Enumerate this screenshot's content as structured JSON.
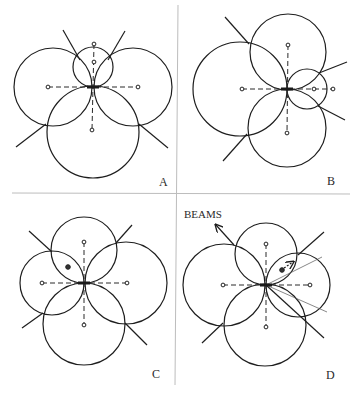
{
  "figure": {
    "dividers": {
      "vertical": {
        "x1": 178,
        "y1": 5,
        "x2": 175,
        "y2": 385
      },
      "horizontal": {
        "x1": 12,
        "y1": 193,
        "x2": 350,
        "y2": 194
      }
    },
    "panels": [
      {
        "label": "A",
        "label_pos": [
          159,
          186
        ],
        "center": [
          93,
          87
        ],
        "circles": [
          {
            "cx": 93,
            "cy": 67,
            "r": 20
          },
          {
            "cx": 53,
            "cy": 87,
            "r": 39
          },
          {
            "cx": 133,
            "cy": 87,
            "r": 39
          },
          {
            "cx": 93,
            "cy": 132,
            "r": 46
          }
        ],
        "dots": [
          [
            94,
            44
          ],
          [
            94,
            62
          ],
          [
            48,
            87
          ],
          [
            138,
            87
          ],
          [
            92,
            130
          ]
        ],
        "dashed": [
          [
            [
              94,
              44
            ],
            [
              92,
              130
            ]
          ],
          [
            [
              48,
              87
            ],
            [
              138,
              87
            ]
          ]
        ],
        "beams": [
          [
            [
              63,
              30
            ],
            [
              80,
              60
            ]
          ],
          [
            [
              125,
              31
            ],
            [
              108,
              60
            ]
          ],
          [
            [
              16,
              147
            ],
            [
              46,
              124
            ]
          ],
          [
            [
              139,
              124
            ],
            [
              168,
              148
            ]
          ]
        ]
      },
      {
        "label": "B",
        "label_pos": [
          327,
          185
        ],
        "center": [
          287,
          89
        ],
        "circles": [
          {
            "cx": 288,
            "cy": 52,
            "r": 38
          },
          {
            "cx": 240,
            "cy": 89,
            "r": 47
          },
          {
            "cx": 307,
            "cy": 89,
            "r": 20
          },
          {
            "cx": 287,
            "cy": 128,
            "r": 39
          }
        ],
        "dots": [
          [
            288,
            45
          ],
          [
            242,
            89
          ],
          [
            314,
            89
          ],
          [
            333,
            89
          ],
          [
            287,
            133
          ]
        ],
        "dashed": [
          [
            [
              288,
              45
            ],
            [
              287,
              133
            ]
          ],
          [
            [
              242,
              89
            ],
            [
              333,
              89
            ]
          ]
        ],
        "beams": [
          [
            [
              225,
              17
            ],
            [
              249,
              44
            ]
          ],
          [
            [
              223,
              161
            ],
            [
              247,
              134
            ]
          ],
          [
            [
              319,
              73
            ],
            [
              347,
              62
            ]
          ],
          [
            [
              318,
              106
            ],
            [
              345,
              120
            ]
          ]
        ]
      },
      {
        "label": "C",
        "label_pos": [
          152,
          378
        ],
        "center": [
          84,
          283
        ],
        "circles": [
          {
            "cx": 84,
            "cy": 250,
            "r": 33
          },
          {
            "cx": 52,
            "cy": 283,
            "r": 32
          },
          {
            "cx": 126,
            "cy": 283,
            "r": 41
          },
          {
            "cx": 84,
            "cy": 324,
            "r": 41
          }
        ],
        "dots": [
          [
            84,
            242
          ],
          [
            42,
            283
          ],
          [
            127,
            283
          ],
          [
            84,
            325
          ],
          [
            68,
            267
          ]
        ],
        "dashed": [
          [
            [
              84,
              242
            ],
            [
              84,
              325
            ]
          ],
          [
            [
              42,
              283
            ],
            [
              127,
              283
            ]
          ]
        ],
        "beams": [
          [
            [
              29,
              231
            ],
            [
              52,
              252
            ]
          ],
          [
            [
              116,
              243
            ],
            [
              132,
              225
            ]
          ],
          [
            [
              22,
              328
            ],
            [
              43,
              313
            ]
          ],
          [
            [
              125,
              323
            ],
            [
              147,
              345
            ]
          ]
        ]
      },
      {
        "label": "D",
        "label_pos": [
          326,
          379
        ],
        "center": [
          266,
          285
        ],
        "circles": [
          {
            "cx": 266,
            "cy": 254,
            "r": 31
          },
          {
            "cx": 224,
            "cy": 285,
            "r": 41
          },
          {
            "cx": 298,
            "cy": 285,
            "r": 32
          },
          {
            "cx": 265,
            "cy": 325,
            "r": 41
          }
        ],
        "dots": [
          [
            266,
            244
          ],
          [
            223,
            285
          ],
          [
            310,
            285
          ],
          [
            266,
            327
          ],
          [
            282,
            270
          ]
        ],
        "dashed": [
          [
            [
              266,
              244
            ],
            [
              266,
              327
            ]
          ],
          [
            [
              223,
              285
            ],
            [
              310,
              285
            ]
          ]
        ],
        "beams": [
          [
            [
              298,
              255
            ],
            [
              324,
              232
            ]
          ],
          [
            [
              266,
              285
            ],
            [
              324,
              338
            ]
          ],
          [
            [
              202,
              343
            ],
            [
              223,
              323
            ]
          ]
        ],
        "thin_lines": [
          [
            [
              266,
              285
            ],
            [
              322,
              257
            ]
          ],
          [
            [
              266,
              285
            ],
            [
              327,
              312
            ]
          ]
        ],
        "beams_label": {
          "text": "BEAMS",
          "pos": [
            184,
            218
          ]
        },
        "beams_arrow": {
          "from": [
            234,
            245
          ],
          "to": [
            216,
            225
          ]
        },
        "motion_arrow": {
          "from": [
            284,
            268
          ],
          "to": [
            293,
            262
          ]
        }
      }
    ]
  }
}
